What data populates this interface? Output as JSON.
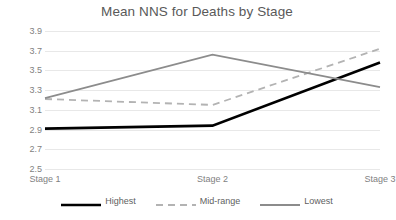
{
  "chart_data": {
    "type": "line",
    "title": "Mean NNS for Deaths by Stage",
    "xlabel": "",
    "ylabel": "",
    "categories": [
      "Stage 1",
      "Stage 2",
      "Stage 3"
    ],
    "ylim": [
      2.5,
      3.9
    ],
    "yticks": [
      "2.5",
      "2.7",
      "2.9",
      "3.1",
      "3.3",
      "3.5",
      "3.7",
      "3.9"
    ],
    "ytick_values": [
      2.5,
      2.7,
      2.9,
      3.1,
      3.3,
      3.5,
      3.7,
      3.9
    ],
    "grid": true,
    "legend_position": "bottom",
    "series": [
      {
        "name": "Highest",
        "values": [
          2.91,
          2.94,
          3.58
        ],
        "color": "#000000",
        "style": "solid",
        "width": 2.6
      },
      {
        "name": "Mid-range",
        "values": [
          3.21,
          3.15,
          3.72
        ],
        "color": "#b3b3b3",
        "style": "dashed",
        "width": 1.8
      },
      {
        "name": "Lowest",
        "values": [
          3.22,
          3.66,
          3.33
        ],
        "color": "#8c8c8c",
        "style": "solid",
        "width": 1.8
      }
    ]
  },
  "colors": {
    "gridline": "#e8e8e8",
    "axis_text": "#7f7f7f",
    "title_text": "#595959",
    "background": "#ffffff"
  }
}
